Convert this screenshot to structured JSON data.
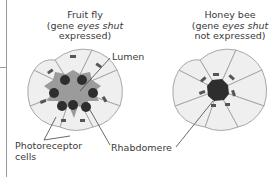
{
  "figure": {
    "fruit_fly": {
      "title_line1": "Fruit fly",
      "title_line2_prefix": "(gene ",
      "title_line2_gene": "eyes shut",
      "title_line3": "expressed)"
    },
    "honey_bee": {
      "title_line1": "Honey bee",
      "title_line2_prefix": "(gene ",
      "title_line2_gene": "eyes shut",
      "title_line3": "not expressed)"
    },
    "labels": {
      "lumen": "Lumen",
      "photoreceptor_line1": "Photoreceptor",
      "photoreceptor_line2": "cells",
      "rhabdomere": "Rhabdomere"
    },
    "colors": {
      "cell_fill": "#efefef",
      "cell_stroke": "#a8a8a8",
      "lumen_fill": "#9b9b9b",
      "rhabdomere_fill": "#2e2e2e",
      "junction_fill": "#555555",
      "line": "#444444"
    }
  }
}
